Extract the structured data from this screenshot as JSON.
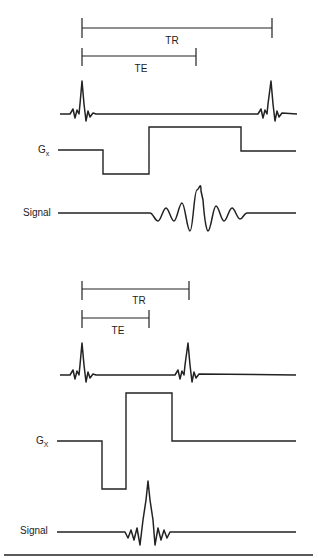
{
  "diagram": {
    "type": "MRI pulse sequence timing diagram",
    "panels": [
      {
        "id": "long-tr",
        "tr_label": "TR",
        "te_label": "TE",
        "gradient_label": "G",
        "gradient_subscript": "x",
        "signal_label": "Signal"
      },
      {
        "id": "short-tr",
        "tr_label": "TR",
        "te_label": "TE",
        "gradient_label": "G",
        "gradient_subscript": "X",
        "signal_label": "Signal"
      }
    ]
  }
}
